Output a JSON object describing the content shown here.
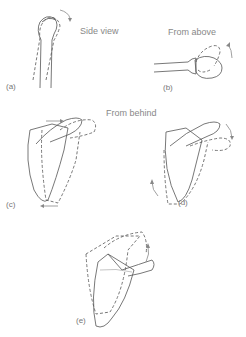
{
  "panels": [
    {
      "id": "a",
      "label": "(a)",
      "caption": "Side view"
    },
    {
      "id": "b",
      "label": "(b)",
      "caption": "From above"
    },
    {
      "id": "c",
      "label": "(c)",
      "caption": "From behind"
    },
    {
      "id": "d",
      "label": "(d)",
      "caption": ""
    },
    {
      "id": "e",
      "label": "(e)",
      "caption": ""
    }
  ]
}
